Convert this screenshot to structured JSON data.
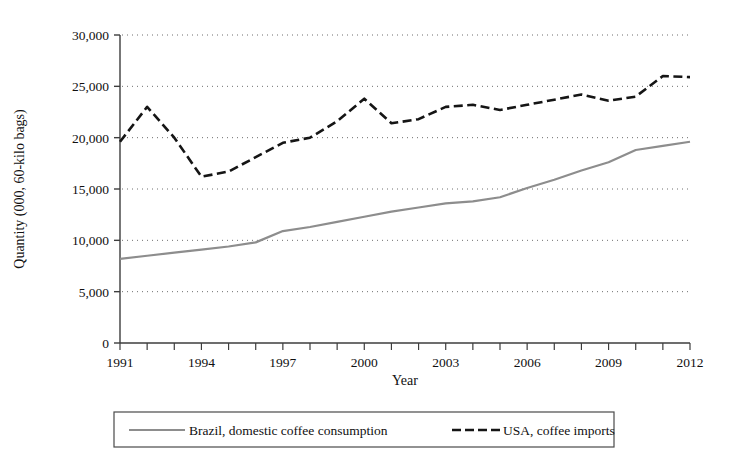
{
  "chart_data": {
    "type": "line",
    "title": "",
    "xlabel": "Year",
    "ylabel": "Quantity (000, 60-kilo bags)",
    "xlim": [
      1991,
      2012
    ],
    "ylim": [
      0,
      30000
    ],
    "grid": true,
    "grid_style": "dotted horizontal",
    "legend_position": "bottom",
    "x": [
      1991,
      1992,
      1993,
      1994,
      1995,
      1996,
      1997,
      1998,
      1999,
      2000,
      2001,
      2002,
      2003,
      2004,
      2005,
      2006,
      2007,
      2008,
      2009,
      2010,
      2011,
      2012
    ],
    "xticks": [
      1991,
      1994,
      1997,
      2000,
      2003,
      2006,
      2009,
      2012
    ],
    "xticklabels": [
      "1991",
      "1994",
      "1997",
      "2000",
      "2003",
      "2006",
      "2009",
      "2012"
    ],
    "xminorticks": [
      1991,
      1992,
      1993,
      1994,
      1995,
      1996,
      1997,
      1998,
      1999,
      2000,
      2001,
      2002,
      2003,
      2004,
      2005,
      2006,
      2007,
      2008,
      2009,
      2010,
      2011,
      2012
    ],
    "yticks": [
      0,
      5000,
      10000,
      15000,
      20000,
      25000,
      30000
    ],
    "yticklabels": [
      "0",
      "5,000",
      "10,000",
      "15,000",
      "20,000",
      "25,000",
      "30,000"
    ],
    "series": [
      {
        "name": "Brazil, domestic coffee consumption",
        "color": "#8d8d8d",
        "style": "solid",
        "width": 2.2,
        "values": [
          8200,
          8500,
          8800,
          9100,
          9400,
          9800,
          10900,
          11300,
          11800,
          12300,
          12800,
          13200,
          13600,
          13800,
          14200,
          15100,
          15900,
          16800,
          17600,
          18800,
          19200,
          19600
        ]
      },
      {
        "name": "USA, coffee imports",
        "color": "#151515",
        "style": "dashed",
        "width": 2.6,
        "values": [
          19600,
          23000,
          20000,
          16200,
          16700,
          18100,
          19500,
          20000,
          21600,
          23800,
          21400,
          21800,
          23000,
          23200,
          22700,
          23200,
          23700,
          24200,
          23600,
          24000,
          26000,
          25900
        ]
      }
    ],
    "legend": [
      {
        "label": "Brazil, domestic coffee consumption",
        "color": "#8d8d8d",
        "style": "solid"
      },
      {
        "label": "USA, coffee imports",
        "color": "#151515",
        "style": "dashed"
      }
    ]
  },
  "axes": {
    "y_title": "Quantity (000, 60-kilo bags)",
    "x_title": "Year"
  }
}
